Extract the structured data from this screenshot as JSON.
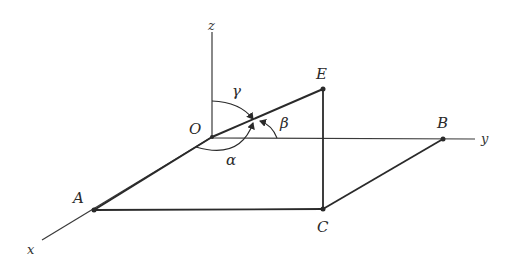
{
  "diagram": {
    "type": "3d-coordinate-vector-direction-angles",
    "axes": {
      "x": {
        "label": "x"
      },
      "y": {
        "label": "y"
      },
      "z": {
        "label": "z"
      }
    },
    "points": {
      "O": {
        "label": "O"
      },
      "A": {
        "label": "A"
      },
      "B": {
        "label": "B"
      },
      "C": {
        "label": "C"
      },
      "E": {
        "label": "E"
      }
    },
    "angles": {
      "alpha": {
        "label": "α"
      },
      "beta": {
        "label": "β"
      },
      "gamma": {
        "label": "γ"
      }
    },
    "colors": {
      "line": "#2a2a2a",
      "axis": "#3a3a3a",
      "background": "#ffffff"
    }
  }
}
